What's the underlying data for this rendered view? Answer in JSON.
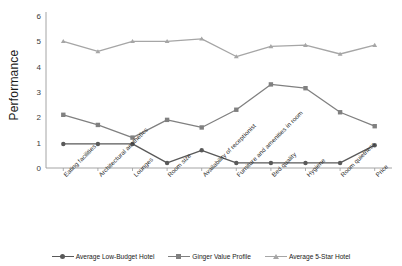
{
  "chart_data": {
    "type": "line",
    "title": "",
    "xlabel": "",
    "ylabel": "Performance",
    "ylim": [
      0,
      6
    ],
    "yticks": [
      0,
      1,
      2,
      3,
      4,
      5,
      6
    ],
    "grid": false,
    "legend_position": "bottom",
    "categories": [
      "Eating facilities",
      "Architectural aesthetics",
      "Lounges",
      "Room size",
      "Availability of receptionist",
      "Furniture and amenities in room",
      "Bed quality",
      "Hygiene",
      "Room quietness",
      "Price"
    ],
    "series": [
      {
        "name": "Average Low-Budget Hotel",
        "color": "#595959",
        "marker": "circle",
        "values": [
          0.95,
          0.95,
          0.95,
          0.2,
          0.7,
          0.2,
          0.2,
          0.2,
          0.2,
          0.9
        ]
      },
      {
        "name": "Ginger Value Profile",
        "color": "#808080",
        "marker": "square",
        "values": [
          2.1,
          1.7,
          1.2,
          1.9,
          1.6,
          2.3,
          3.3,
          3.15,
          2.2,
          1.65
        ]
      },
      {
        "name": "Average 5-Star Hotel",
        "color": "#a6a6a6",
        "marker": "triangle",
        "values": [
          5.0,
          4.6,
          5.0,
          5.0,
          5.1,
          4.4,
          4.8,
          4.85,
          4.5,
          4.85
        ]
      }
    ]
  },
  "axis": {
    "y_title": "Performance",
    "tick_0": "0",
    "tick_1": "1",
    "tick_2": "2",
    "tick_3": "3",
    "tick_4": "4",
    "tick_5": "5",
    "tick_6": "6"
  },
  "legend": {
    "items": [
      {
        "label": "Average Low-Budget Hotel"
      },
      {
        "label": "Ginger Value Profile"
      },
      {
        "label": "Average 5-Star Hotel"
      }
    ]
  }
}
